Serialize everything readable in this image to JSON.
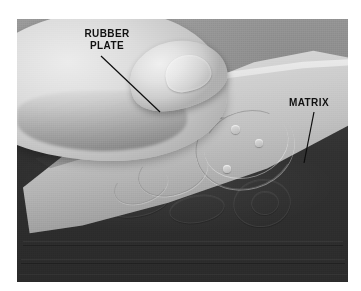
{
  "figure": {
    "type": "photograph",
    "page_background": "#ffffff",
    "photo": {
      "x": 17,
      "y": 19,
      "width": 331,
      "height": 263,
      "tone": "grayscale"
    },
    "annotations": [
      {
        "id": "rubber-plate",
        "label": "RUBBER\nPLATE",
        "line1": "RUBBER",
        "line2": "PLATE",
        "text_color": "#111111",
        "label_x": 78,
        "label_y": 28,
        "leader": {
          "x1": 101,
          "y1": 56,
          "x2": 160,
          "y2": 112
        }
      },
      {
        "id": "matrix",
        "label": "MATRIX",
        "line1": "MATRIX",
        "line2": "",
        "text_color": "#111111",
        "label_x": 289,
        "label_y": 97,
        "leader": {
          "x1": 314,
          "y1": 112,
          "x2": 304,
          "y2": 163
        }
      }
    ],
    "subjects": [
      {
        "name": "hand",
        "tone": "light-gray"
      },
      {
        "name": "rubber-plate",
        "tone": "light-gray"
      },
      {
        "name": "matrix-board",
        "tone": "dark-gray"
      },
      {
        "name": "background",
        "tone": "mid-gray"
      }
    ]
  }
}
